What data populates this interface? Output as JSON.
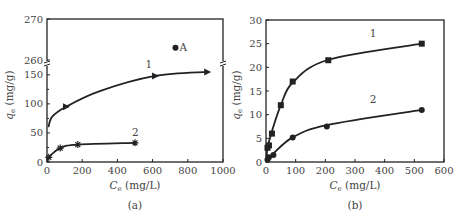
{
  "chart_data": [
    {
      "type": "scatter",
      "panel_label": "(a)",
      "xlabel": "Ce (mg/L)",
      "xlabel_main": "C",
      "xlabel_sub": "e",
      "xlabel_unit": " (mg/L)",
      "ylabel": "qe (mg/g)",
      "ylabel_main": "q",
      "ylabel_sub": "e",
      "ylabel_unit": " (mg/g)",
      "xlim": [
        0,
        1000
      ],
      "ylim_broken": {
        "lower": [
          0,
          160
        ],
        "upper": [
          260,
          270
        ]
      },
      "x_ticks": [
        "0",
        "200",
        "400",
        "600",
        "800",
        "1000"
      ],
      "y_ticks": [
        "0",
        "50",
        "100",
        "150",
        "260",
        "270"
      ],
      "grid": false,
      "series": [
        {
          "name": "1",
          "marker": "triangle-right",
          "x": [
            108,
            614,
            910
          ],
          "y": [
            95,
            148,
            155
          ]
        },
        {
          "name": "2",
          "marker": "star",
          "x": [
            10,
            75,
            175,
            500
          ],
          "y": [
            8,
            24,
            30,
            33
          ]
        },
        {
          "name": "A",
          "marker": "circle",
          "x": [
            730
          ],
          "y": [
            263
          ]
        }
      ]
    },
    {
      "type": "scatter",
      "panel_label": "(b)",
      "xlabel": "Ce (mg/L)",
      "xlabel_main": "C",
      "xlabel_sub": "e",
      "xlabel_unit": " (mg/L)",
      "ylabel": "qe (mg/g)",
      "ylabel_main": "q",
      "ylabel_sub": "e",
      "ylabel_unit": " (mg/g)",
      "xlim": [
        0,
        600
      ],
      "ylim": [
        0,
        30
      ],
      "x_ticks": [
        "0",
        "100",
        "200",
        "300",
        "400",
        "500",
        "600"
      ],
      "y_ticks": [
        "0",
        "5",
        "10",
        "15",
        "20",
        "25",
        "30"
      ],
      "grid": false,
      "series": [
        {
          "name": "1",
          "marker": "square",
          "x": [
            5,
            10,
            20,
            50,
            90,
            210,
            525
          ],
          "y": [
            3,
            3.5,
            6,
            12,
            17,
            21.5,
            25
          ]
        },
        {
          "name": "2",
          "marker": "circle",
          "x": [
            5,
            10,
            25,
            90,
            205,
            525
          ],
          "y": [
            0.5,
            1,
            1.5,
            5.2,
            7.5,
            11
          ]
        }
      ]
    }
  ],
  "colors": {
    "line": "#222222",
    "axis": "#222222",
    "text": "#444444"
  }
}
